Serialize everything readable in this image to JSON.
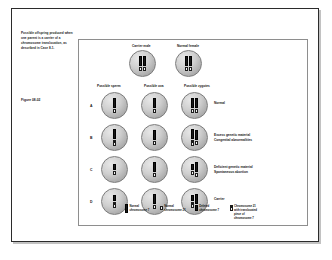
{
  "caption": {
    "text": "Possible offspring produced when one parent is a carrier of a chromosome translocation, as described in Case 8-1.",
    "figure_number": "Figure 08-02"
  },
  "parents": [
    {
      "label": "Carrier male"
    },
    {
      "label": "Normal female"
    }
  ],
  "column_headers": [
    "Possible sperm",
    "Possible ova",
    "Possible zygotes"
  ],
  "rows": [
    {
      "letter": "A",
      "outcome": "Normal",
      "sperm": [
        [
          "c7"
        ],
        [
          "c21"
        ]
      ],
      "ova": [
        [
          "c7"
        ],
        [
          "c21"
        ]
      ],
      "zygote": [
        [
          "c7"
        ],
        [
          "c21"
        ],
        [
          "c7"
        ],
        [
          "c21"
        ]
      ]
    },
    {
      "letter": "B",
      "outcome": "Excess genetic material\nCongenital abnormalities",
      "sperm": [
        [
          "c7"
        ],
        [
          "c21t"
        ]
      ],
      "ova": [
        [
          "c7"
        ],
        [
          "c21"
        ]
      ],
      "zygote": [
        [
          "c7"
        ],
        [
          "c21t"
        ],
        [
          "c7"
        ],
        [
          "c21"
        ]
      ]
    },
    {
      "letter": "C",
      "outcome": "Deficient genetic material\nSpontaneous abortion",
      "sperm": [
        [
          "c7del"
        ],
        [
          "c21"
        ]
      ],
      "ova": [
        [
          "c7"
        ],
        [
          "c21"
        ]
      ],
      "zygote": [
        [
          "c7del"
        ],
        [
          "c21"
        ],
        [
          "c7"
        ],
        [
          "c21"
        ]
      ]
    },
    {
      "letter": "D",
      "outcome": "Carrier",
      "sperm": [
        [
          "c7del"
        ],
        [
          "c21t"
        ]
      ],
      "ova": [
        [
          "c7"
        ],
        [
          "c21"
        ]
      ],
      "zygote": [
        [
          "c7del"
        ],
        [
          "c21t"
        ],
        [
          "c7"
        ],
        [
          "c21"
        ]
      ]
    }
  ],
  "legend": [
    {
      "swatch": "normal-chromosome-7-swatch",
      "text": "Normal chromosome 7"
    },
    {
      "swatch": "normal-chromosome-21-swatch",
      "text": "Normal chromosome 21"
    },
    {
      "swatch": "deleted-chromosome-7-swatch",
      "text": "Deleted chromosome 7"
    },
    {
      "swatch": "translocated-chromosome-21-swatch",
      "text": "Chromosome 21 with translocated piece of chromosome 7"
    }
  ],
  "colors": {
    "chromosome_dark": "#181818",
    "chromosome_light": "#f2f2f2",
    "cell_fill": "#cfcfcf",
    "panel_border": "#8e8e8e",
    "page_border": "#2b2b2b"
  }
}
